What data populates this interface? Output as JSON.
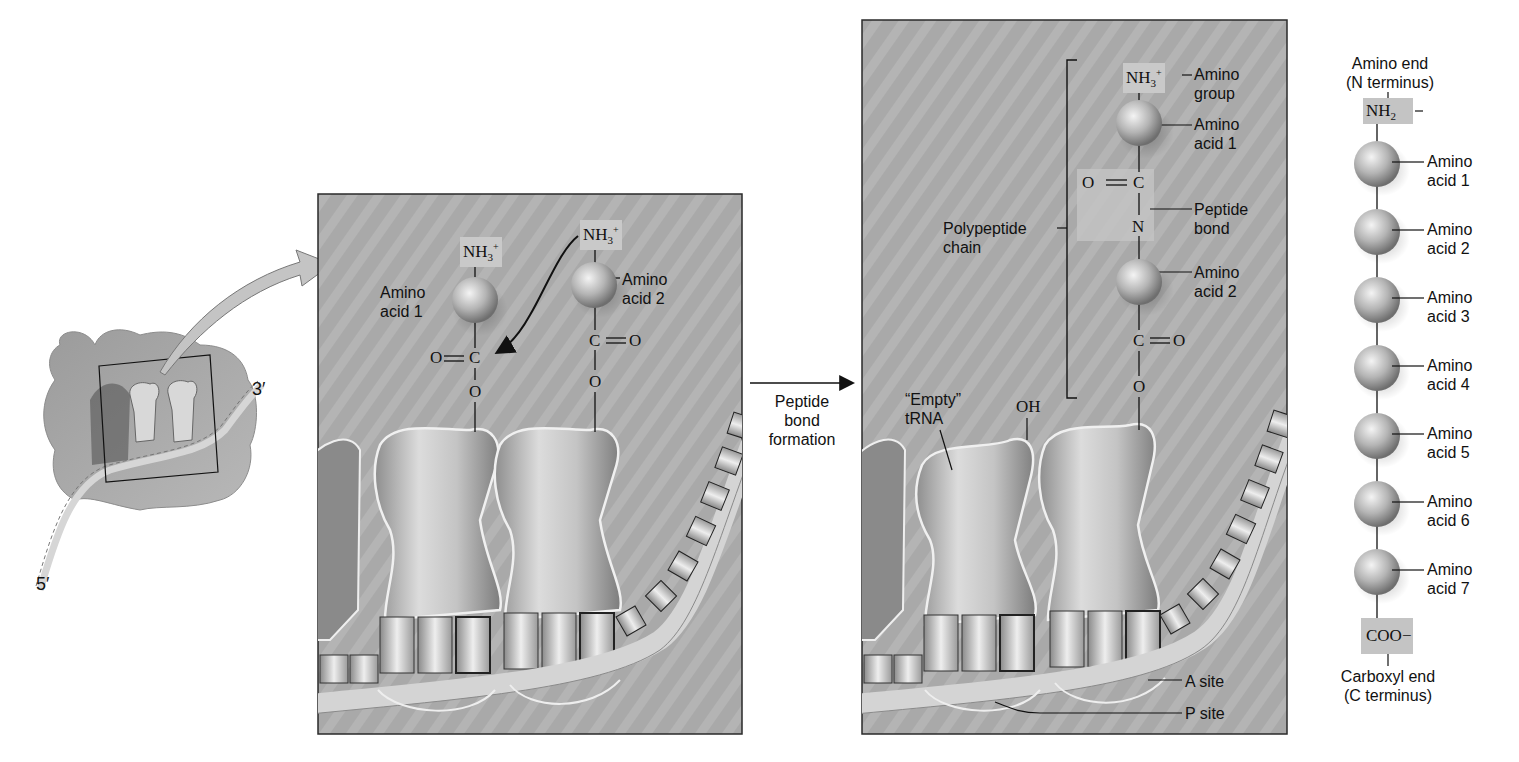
{
  "figure": {
    "colors": {
      "panel_bg": "#a8a8a8",
      "panel_border": "#2a2a2a",
      "highlight_box": "#c9c9c9",
      "sphere_light": "#e6e6e6",
      "sphere_dark": "#7d7d7d",
      "mrna": "#d2d2d2",
      "trna_fill": "#cfcfcf"
    }
  },
  "overview": {
    "end_3": "3′",
    "end_5": "5′"
  },
  "panel_before": {
    "aa1": {
      "amino": "NH3+",
      "label_line1": "Amino",
      "label_line2": "acid 1",
      "carbonyl_o": "O",
      "carbon": "C",
      "ester_o": "O"
    },
    "aa2": {
      "amino": "NH3+",
      "label_line1": "Amino",
      "label_line2": "acid 2",
      "carbon": "C",
      "carbonyl_o": "O",
      "ester_o": "O"
    }
  },
  "transition": {
    "line1": "Peptide",
    "line2": "bond",
    "line3": "formation"
  },
  "panel_after": {
    "amino_group": {
      "formula": "NH3+",
      "label_line1": "Amino",
      "label_line2": "group"
    },
    "aa1": {
      "label_line1": "Amino",
      "label_line2": "acid 1"
    },
    "peptide_bond": {
      "o": "O",
      "c": "C",
      "n": "N",
      "label_line1": "Peptide",
      "label_line2": "bond"
    },
    "aa2": {
      "label_line1": "Amino",
      "label_line2": "acid 2"
    },
    "carboxyl": {
      "c": "C",
      "o": "O",
      "ester_o": "O"
    },
    "polypeptide": {
      "label_line1": "Polypeptide",
      "label_line2": "chain"
    },
    "empty_trna": {
      "label_line1": "“Empty”",
      "label_line2": "tRNA",
      "oh": "OH"
    },
    "sites": {
      "a_site": "A site",
      "p_site": "P site"
    }
  },
  "chain": {
    "amino_end_line1": "Amino end",
    "amino_end_line2": "(N terminus)",
    "n_group": "NH2",
    "residues": [
      {
        "line1": "Amino",
        "line2": "acid 1"
      },
      {
        "line1": "Amino",
        "line2": "acid 2"
      },
      {
        "line1": "Amino",
        "line2": "acid 3"
      },
      {
        "line1": "Amino",
        "line2": "acid 4"
      },
      {
        "line1": "Amino",
        "line2": "acid 5"
      },
      {
        "line1": "Amino",
        "line2": "acid 6"
      },
      {
        "line1": "Amino",
        "line2": "acid 7"
      }
    ],
    "c_group": "COO−",
    "carboxyl_end_line1": "Carboxyl end",
    "carboxyl_end_line2": "(C terminus)"
  }
}
